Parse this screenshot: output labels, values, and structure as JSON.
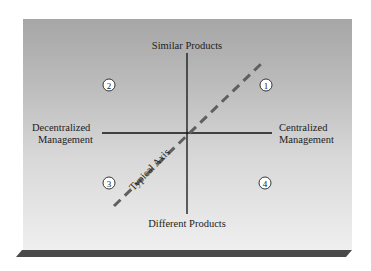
{
  "diagram": {
    "axes": {
      "top": "Similar Products",
      "bottom": "Different Products",
      "left_line1": "Decentralized",
      "left_line2": "Management",
      "right_line1": "Centralized",
      "right_line2": "Management"
    },
    "diagonal_label": "Typical Axis",
    "quadrants": [
      {
        "id": "1",
        "label": "1",
        "position": "top-right"
      },
      {
        "id": "2",
        "label": "2",
        "position": "top-left"
      },
      {
        "id": "3",
        "label": "3",
        "position": "bottom-left"
      },
      {
        "id": "4",
        "label": "4",
        "position": "bottom-right"
      }
    ],
    "colors": {
      "axis_line": "#111111",
      "dashed_axis": "#5a5a5a",
      "shadow": "#4a4a4a"
    }
  }
}
